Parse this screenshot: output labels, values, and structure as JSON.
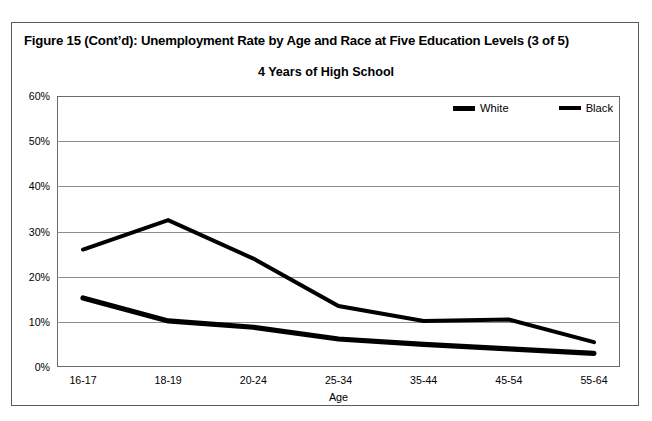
{
  "figure": {
    "title": "Figure 15 (Cont’d): Unemployment Rate by Age and Race at Five Education Levels (3 of 5)"
  },
  "legend": {
    "position": "top-right-inside",
    "entries": [
      {
        "label": "White",
        "swatch": "thick-black-line",
        "color": "#000000"
      },
      {
        "label": "Black",
        "swatch": "thick-black-line",
        "color": "#000000"
      }
    ]
  },
  "chart_data": {
    "type": "line",
    "title": "4 Years of High School",
    "xlabel": "Age",
    "ylabel": "",
    "categories": [
      "16-17",
      "18-19",
      "20-24",
      "25-34",
      "35-44",
      "45-54",
      "55-64"
    ],
    "ytick_labels": [
      "0%",
      "10%",
      "20%",
      "30%",
      "40%",
      "50%",
      "60%"
    ],
    "yticks": [
      0,
      10,
      20,
      30,
      40,
      50,
      60
    ],
    "ylim": [
      0,
      60
    ],
    "grid": true,
    "grid_axis": "y",
    "legend_position": "upper right",
    "series": [
      {
        "name": "White",
        "color": "#000000",
        "values": [
          15.3,
          10.2,
          8.8,
          6.2,
          5.0,
          4.0,
          3.0
        ]
      },
      {
        "name": "Black",
        "color": "#000000",
        "values": [
          26.0,
          32.5,
          24.0,
          13.5,
          10.2,
          10.5,
          5.5
        ]
      }
    ]
  }
}
